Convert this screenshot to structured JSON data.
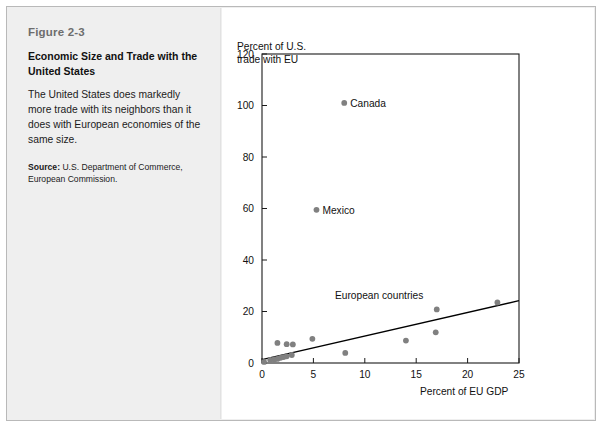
{
  "figure": {
    "number": "Figure 2-3",
    "title": "Economic Size and Trade with the United States",
    "description": "The United States does markedly more trade with its neighbors than it does with European economies of the same size.",
    "source_label": "Source:",
    "source_text": " U.S. Department of Commerce, European Commission."
  },
  "chart_data": {
    "type": "scatter",
    "title": "",
    "ylabel": "Percent of U.S.\ntrade with EU",
    "xlabel": "Percent of EU GDP",
    "xlim": [
      0,
      25
    ],
    "ylim": [
      0,
      120
    ],
    "xticks": [
      0,
      5,
      10,
      15,
      20,
      25
    ],
    "yticks": [
      0,
      20,
      40,
      60,
      80,
      100,
      120
    ],
    "xtick_labels": [
      "0",
      "5",
      "10",
      "15",
      "20",
      "25"
    ],
    "ytick_labels": [
      "0",
      "20",
      "40",
      "60",
      "80",
      "100",
      "120"
    ],
    "grid": false,
    "legend_position": "none",
    "point_color": "#808080",
    "line_color": "#000000",
    "axis_color": "#1a1a1a",
    "annotations": [
      {
        "text": "Canada",
        "x": 8.0,
        "y": 101.0
      },
      {
        "text": "Mexico",
        "x": 5.3,
        "y": 59.5
      },
      {
        "text": "European countries",
        "x": 11.4,
        "y": 26.5
      }
    ],
    "series": [
      {
        "name": "Labeled North American partners",
        "points": [
          {
            "label": "Canada",
            "x": 8.0,
            "y": 101.0
          },
          {
            "label": "Mexico",
            "x": 5.3,
            "y": 59.5
          }
        ]
      },
      {
        "name": "European countries",
        "points": [
          {
            "label": "",
            "x": 0.2,
            "y": 0.4
          },
          {
            "label": "",
            "x": 0.8,
            "y": 1.2
          },
          {
            "label": "",
            "x": 1.2,
            "y": 1.4
          },
          {
            "label": "",
            "x": 1.5,
            "y": 1.6
          },
          {
            "label": "",
            "x": 1.5,
            "y": 7.8
          },
          {
            "label": "",
            "x": 1.8,
            "y": 2.0
          },
          {
            "label": "",
            "x": 2.1,
            "y": 2.3
          },
          {
            "label": "",
            "x": 2.4,
            "y": 2.6
          },
          {
            "label": "",
            "x": 2.4,
            "y": 7.3
          },
          {
            "label": "",
            "x": 2.9,
            "y": 3.1
          },
          {
            "label": "",
            "x": 3.0,
            "y": 7.2
          },
          {
            "label": "",
            "x": 4.9,
            "y": 9.4
          },
          {
            "label": "",
            "x": 8.1,
            "y": 3.9
          },
          {
            "label": "",
            "x": 14.0,
            "y": 8.7
          },
          {
            "label": "",
            "x": 16.9,
            "y": 11.9
          },
          {
            "label": "",
            "x": 17.0,
            "y": 20.8
          },
          {
            "label": "",
            "x": 22.9,
            "y": 23.5
          }
        ]
      }
    ],
    "trendline": {
      "name": "fitted line",
      "x_start": 0.0,
      "y_start": 1.3,
      "x_end": 25.0,
      "y_end": 24.2
    }
  }
}
